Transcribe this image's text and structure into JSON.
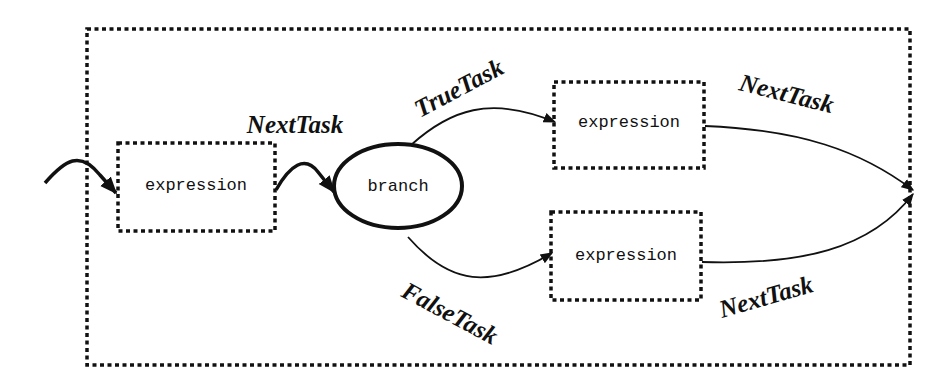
{
  "diagram": {
    "nodes": {
      "expression_main": "expression",
      "branch": "branch",
      "expression_true": "expression",
      "expression_false": "expression"
    },
    "edges": {
      "next_task_main": "NextTask",
      "true_task": "TrueTask",
      "false_task": "FalseTask",
      "next_task_true": "NextTask",
      "next_task_false": "NextTask"
    },
    "colors": {
      "stroke": "#111111",
      "background": "#ffffff"
    }
  }
}
